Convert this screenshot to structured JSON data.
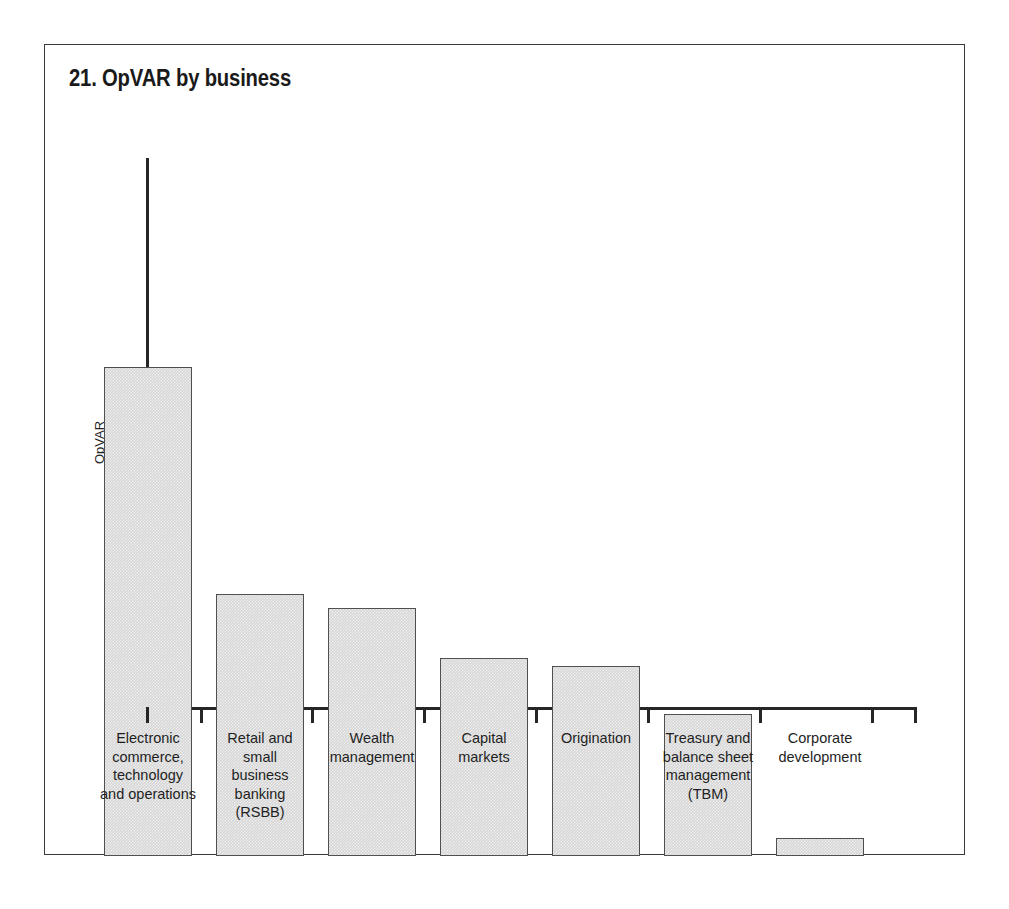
{
  "figure": {
    "title": "21. OpVAR by business",
    "frame_color": "#3a3a3a",
    "background": "#ffffff"
  },
  "axes": {
    "y_axis_title": "OpVAR",
    "x_axis_title": "",
    "axis_color": "#262626"
  },
  "style": {
    "bar_fill": "#d6d6d6",
    "bar_stroke": "#4f4f4f",
    "text_color": "#1f1f1f"
  },
  "chart_data": {
    "type": "bar",
    "title": "21. OpVAR by business",
    "xlabel": "",
    "ylabel": "OpVAR",
    "grid": false,
    "legend": false,
    "y_tick_labels": [],
    "x_tick_labels": [],
    "note": "Unlabeled ordinal y-axis; values are relative bar heights read in pixels and normalized to the tallest bar = 100.",
    "categories": [
      "Electronic\ncommerce,\ntechnology\nand operations",
      "Retail and\nsmall\nbusiness\nbanking\n(RSBB)",
      "Wealth\nmanagement",
      "Capital\nmarkets",
      "Origination",
      "Treasury and\nbalance sheet\nmanagement\n(TBM)",
      "Corporate\ndevelopment"
    ],
    "categories_flat": [
      "Electronic commerce, technology and operations",
      "Retail and small business banking (RSBB)",
      "Wealth management",
      "Capital markets",
      "Origination",
      "Treasury and balance sheet management (TBM)",
      "Corporate development"
    ],
    "values": [
      100,
      53.6,
      50.7,
      40.5,
      38.9,
      29.0,
      3.7
    ],
    "values_px": [
      489,
      262,
      248,
      198,
      190,
      142,
      18
    ],
    "ylim": [
      0,
      100
    ]
  },
  "bars": [
    {
      "label": "Electronic\ncommerce,\ntechnology\nand operations",
      "value": 100,
      "height_px": 489,
      "left_px": 59,
      "width_px": 88,
      "label_left_px": 40,
      "label_width_px": 126
    },
    {
      "label": "Retail and\nsmall\nbusiness\nbanking\n(RSBB)",
      "value": 53.6,
      "height_px": 262,
      "left_px": 171,
      "width_px": 88,
      "label_left_px": 160,
      "label_width_px": 110
    },
    {
      "label": "Wealth\nmanagement",
      "value": 50.7,
      "height_px": 248,
      "left_px": 283,
      "width_px": 88,
      "label_left_px": 268,
      "label_width_px": 118
    },
    {
      "label": "Capital\nmarkets",
      "value": 40.5,
      "height_px": 198,
      "left_px": 395,
      "width_px": 88,
      "label_left_px": 383,
      "label_width_px": 112
    },
    {
      "label": "Origination",
      "value": 38.9,
      "height_px": 190,
      "left_px": 507,
      "width_px": 88,
      "label_left_px": 493,
      "label_width_px": 116
    },
    {
      "label": "Treasury and\nbalance sheet\nmanagement\n(TBM)",
      "value": 29.0,
      "height_px": 142,
      "left_px": 619,
      "width_px": 88,
      "label_left_px": 597,
      "label_width_px": 132
    },
    {
      "label": "Corporate\ndevelopment",
      "value": 3.7,
      "height_px": 18,
      "left_px": 731,
      "width_px": 88,
      "label_left_px": 714,
      "label_width_px": 122
    }
  ],
  "ticks_px": [
    101,
    155,
    266,
    378,
    490,
    602,
    714,
    826,
    869
  ]
}
